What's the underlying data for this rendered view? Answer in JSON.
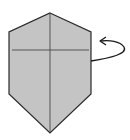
{
  "diagram": {
    "paper_fill": "#c4c4c4",
    "line_color": "#2a2a2a",
    "arrow": {
      "meaning": "turn over"
    }
  }
}
